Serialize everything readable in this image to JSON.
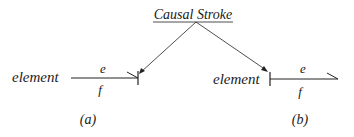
{
  "title": "Causal Stroke",
  "diagrams": [
    {
      "label": "(a)",
      "element_label": "element",
      "effort_label": "e",
      "flow_label": "f"
    },
    {
      "label": "(b)",
      "element_label": "element",
      "effort_label": "e",
      "flow_label": "f"
    }
  ],
  "colors": {
    "line": "#222222",
    "text": "#1a1a1a",
    "background": "#ffffff"
  }
}
